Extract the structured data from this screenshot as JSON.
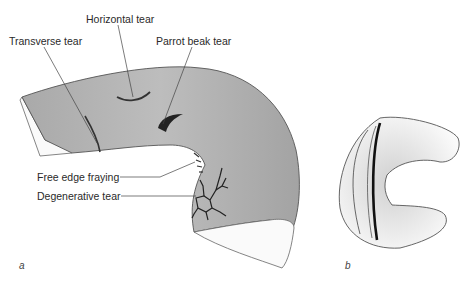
{
  "figure": {
    "panel_a": {
      "letter": "a",
      "labels": {
        "horizontal_tear": "Horizontal tear",
        "transverse_tear": "Transverse tear",
        "parrot_beak_tear": "Parrot beak tear",
        "free_edge_fraying": "Free edge fraying",
        "degenerative_tear": "Degenerative tear"
      }
    },
    "panel_b": {
      "letter": "b"
    }
  }
}
